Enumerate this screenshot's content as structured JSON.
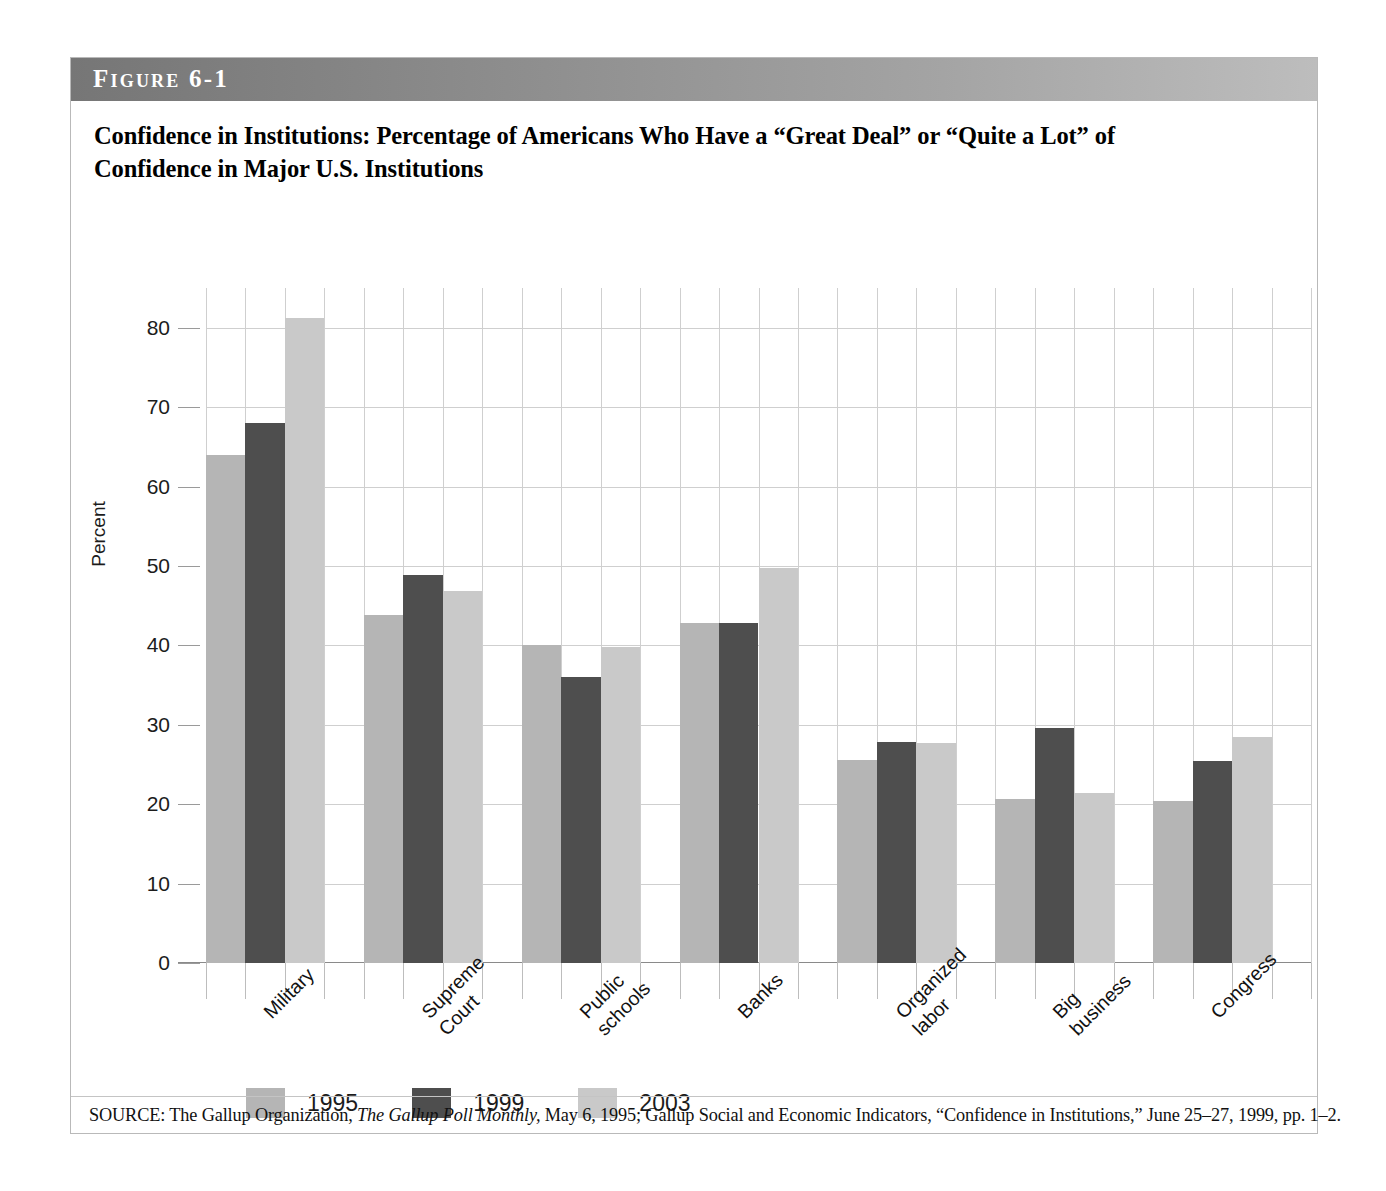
{
  "figure": {
    "band_label": "Figure 6-1",
    "title": "Confidence in Institutions: Percentage of Americans Who Have a “Great Deal” or “Quite a Lot” of Confidence in Major U.S. Institutions",
    "source_prefix": "SOURCE: The Gallup Organization, ",
    "source_italic": "The Gallup Poll Monthly,",
    "source_suffix": " May 6, 1995; Gallup Social and Economic Indicators, “Confidence in Institutions,” June 25–27, 1999, pp. 1–2."
  },
  "colors": {
    "series_1995": "#b5b5b5",
    "series_1999": "#4e4e4e",
    "series_2003": "#c9c9c9",
    "band_dark": "#767676",
    "band_light": "#bdbdbd",
    "gridline": "#cfcfcf",
    "axis": "#8a8a8a"
  },
  "chart_data": {
    "type": "bar",
    "title": "Confidence in Institutions: Percentage of Americans Who Have a “Great Deal” or “Quite a Lot” of Confidence in Major U.S. Institutions",
    "xlabel": "",
    "ylabel": "Percent",
    "ylim": [
      0,
      85
    ],
    "yticks": [
      0,
      10,
      20,
      30,
      40,
      50,
      60,
      70,
      80
    ],
    "ytick_labels": [
      "0",
      "10",
      "20",
      "30",
      "40",
      "50",
      "60",
      "70",
      "80"
    ],
    "grid": true,
    "legend_position": "bottom-left",
    "categories": [
      "Military",
      "Supreme\nCourt",
      "Public\nschools",
      "Banks",
      "Organized\nlabor",
      "Big\nbusiness",
      "Congress"
    ],
    "series": [
      {
        "name": "1995",
        "color": "#b5b5b5",
        "values": [
          64.0,
          43.8,
          40.0,
          42.8,
          25.6,
          20.6,
          20.4
        ]
      },
      {
        "name": "1999",
        "color": "#4e4e4e",
        "values": [
          68.0,
          48.9,
          36.0,
          42.8,
          27.8,
          29.6,
          25.4
        ]
      },
      {
        "name": "2003",
        "color": "#c9c9c9",
        "values": [
          81.2,
          46.8,
          39.8,
          49.8,
          27.7,
          21.4,
          28.4
        ]
      }
    ]
  }
}
